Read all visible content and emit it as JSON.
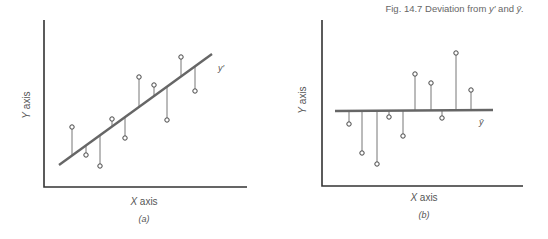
{
  "caption": {
    "prefix": "Fig. 14.7",
    "text": "Deviation from",
    "sym1": "y′",
    "and": "and",
    "sym2": "ȳ."
  },
  "panels": [
    {
      "id": "a",
      "label": "(a)",
      "xlabel_var": "X",
      "xlabel_word": "axis",
      "ylabel_var": "Y",
      "ylabel_word": "axis",
      "line_label": "y′",
      "line_type": "regression"
    },
    {
      "id": "b",
      "label": "(b)",
      "xlabel_var": "X",
      "xlabel_word": "axis",
      "ylabel_var": "Y",
      "ylabel_word": "axis",
      "line_label": "ȳ",
      "line_type": "mean"
    }
  ],
  "chart_data": [
    {
      "type": "scatter",
      "title": "(a) Deviation from y′",
      "xlabel": "X axis",
      "ylabel": "Y axis",
      "reference_line": {
        "label": "y′",
        "kind": "regression line",
        "x1": 59,
        "y1": 165,
        "x2": 212,
        "y2": 54
      },
      "points": [
        {
          "x": 72,
          "y": 127,
          "foot_y": 156
        },
        {
          "x": 86,
          "y": 155,
          "foot_y": 146
        },
        {
          "x": 100,
          "y": 166,
          "foot_y": 136
        },
        {
          "x": 112,
          "y": 119,
          "foot_y": 127
        },
        {
          "x": 125,
          "y": 138,
          "foot_y": 118
        },
        {
          "x": 139,
          "y": 77,
          "foot_y": 108
        },
        {
          "x": 154,
          "y": 85,
          "foot_y": 97
        },
        {
          "x": 167,
          "y": 120,
          "foot_y": 87
        },
        {
          "x": 181,
          "y": 57,
          "foot_y": 77
        },
        {
          "x": 195,
          "y": 91,
          "foot_y": 66
        }
      ],
      "axes": {
        "x0": 44,
        "y0": 187,
        "x1": 247,
        "ytop": 20
      },
      "grid": false
    },
    {
      "type": "scatter",
      "title": "(b) Deviation from ȳ",
      "xlabel": "X axis",
      "ylabel": "Y axis",
      "reference_line": {
        "label": "ȳ",
        "kind": "mean line",
        "x1": 335,
        "y1": 111,
        "x2": 493,
        "y2": 110
      },
      "points": [
        {
          "x": 349,
          "y": 124,
          "foot_y": 111
        },
        {
          "x": 362,
          "y": 153,
          "foot_y": 111
        },
        {
          "x": 377,
          "y": 164,
          "foot_y": 111
        },
        {
          "x": 389,
          "y": 117,
          "foot_y": 111
        },
        {
          "x": 403,
          "y": 136,
          "foot_y": 111
        },
        {
          "x": 415,
          "y": 74,
          "foot_y": 111
        },
        {
          "x": 431,
          "y": 83,
          "foot_y": 110
        },
        {
          "x": 442,
          "y": 118,
          "foot_y": 110
        },
        {
          "x": 456,
          "y": 53,
          "foot_y": 110
        },
        {
          "x": 471,
          "y": 90,
          "foot_y": 110
        }
      ],
      "axes": {
        "x0": 322,
        "y0": 186,
        "x1": 523,
        "ytop": 20
      },
      "grid": false
    }
  ]
}
